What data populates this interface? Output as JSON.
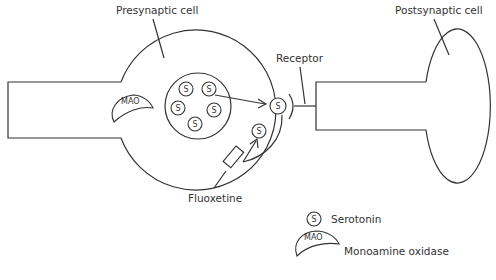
{
  "labels": {
    "presynaptic": "Presynaptic cell",
    "postsynaptic": "Postsynaptic cell",
    "receptor": "Receptor",
    "fluoxetine": "Fluoxetine"
  },
  "symbols": {
    "serotonin": "S",
    "mao": "MAO"
  },
  "legend": {
    "items": [
      {
        "symbol": "S",
        "label": "Serotonin"
      },
      {
        "symbol": "MAO",
        "label": "Monoamine oxidase"
      }
    ]
  },
  "colors": {
    "stroke": "#333333",
    "background": "#ffffff"
  }
}
